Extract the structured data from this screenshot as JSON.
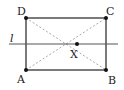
{
  "diagram": {
    "points": {
      "A": {
        "label": "A",
        "x": 26,
        "y": 70
      },
      "B": {
        "label": "B",
        "x": 106,
        "y": 70
      },
      "C": {
        "label": "C",
        "x": 106,
        "y": 18
      },
      "D": {
        "label": "D",
        "x": 26,
        "y": 18
      },
      "X": {
        "label": "X",
        "x": 77,
        "y": 44
      }
    },
    "line": {
      "label": "l"
    },
    "colors": {
      "solid": "#222222",
      "dashed": "#aaaaaa",
      "point": "#111111"
    }
  }
}
